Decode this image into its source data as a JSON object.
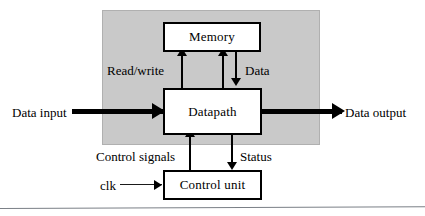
{
  "diagram": {
    "region": {
      "name": "system-region",
      "fill_color": "#c9c9c9"
    },
    "blocks": [
      {
        "id": "memory",
        "label": "Memory"
      },
      {
        "id": "datapath",
        "label": "Datapath"
      },
      {
        "id": "controlunit",
        "label": "Control unit"
      }
    ],
    "edge_labels": {
      "read_write": "Read/write",
      "data": "Data",
      "control_signals": "Control signals",
      "status": "Status"
    },
    "io_labels": {
      "data_input": "Data input",
      "data_output": "Data output",
      "clk": "clk"
    },
    "connectors": [
      {
        "id": "readwrite-arrow",
        "from": "datapath",
        "to": "memory",
        "direction": "up",
        "label": "Read/write"
      },
      {
        "id": "memread-arrow",
        "from": "datapath",
        "to": "memory",
        "direction": "up",
        "label": ""
      },
      {
        "id": "data-arrow",
        "from": "memory",
        "to": "datapath",
        "direction": "down",
        "label": "Data"
      },
      {
        "id": "control-arrow",
        "from": "controlunit",
        "to": "datapath",
        "direction": "up",
        "label": "Control signals"
      },
      {
        "id": "status-arrow",
        "from": "datapath",
        "to": "controlunit",
        "direction": "down",
        "label": "Status"
      },
      {
        "id": "datain-arrow",
        "from": "data input",
        "to": "datapath",
        "direction": "right",
        "label": "Data input"
      },
      {
        "id": "dataout-arrow",
        "from": "datapath",
        "to": "data output",
        "direction": "right",
        "label": "Data output"
      },
      {
        "id": "clk-arrow",
        "from": "clk",
        "to": "controlunit",
        "direction": "right",
        "label": "clk"
      }
    ],
    "colors": {
      "stroke": "#000000",
      "region_fill": "#c9c9c9",
      "box_fill": "#ffffff",
      "rule": "#7a7f86"
    }
  }
}
